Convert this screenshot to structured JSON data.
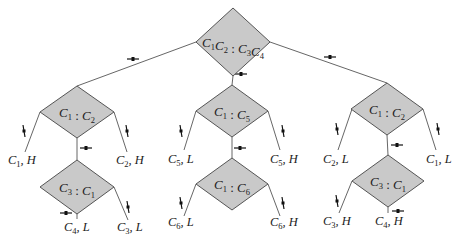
{
  "diagram": {
    "type": "decision-tree-comparison-weighing",
    "colors": {
      "node_fill": "#c9c9c9",
      "node_stroke": "#555555",
      "edge": "#555555",
      "background": "#ffffff"
    },
    "nodes": [
      {
        "id": "root",
        "parts": [
          [
            "C",
            "1"
          ],
          [
            "C",
            "2"
          ],
          [
            " : ",
            ""
          ],
          [
            "C",
            "3"
          ],
          [
            "C",
            "4"
          ]
        ],
        "text": "C1C2 : C3C4",
        "cx": 233,
        "cy": 42,
        "hw": 37,
        "hh": 34
      },
      {
        "id": "left",
        "parts": [
          [
            "C",
            "1"
          ],
          [
            " : ",
            ""
          ],
          [
            "C",
            "2"
          ]
        ],
        "text": "C1 : C2",
        "cx": 77,
        "cy": 112,
        "hw": 37,
        "hh": 26
      },
      {
        "id": "left-low",
        "parts": [
          [
            "C",
            "3"
          ],
          [
            " : ",
            ""
          ],
          [
            "C",
            "1"
          ]
        ],
        "text": "C3 : C1",
        "cx": 77,
        "cy": 187,
        "hw": 37,
        "hh": 27
      },
      {
        "id": "mid",
        "parts": [
          [
            "C",
            "1"
          ],
          [
            " : ",
            ""
          ],
          [
            "C",
            "5"
          ]
        ],
        "text": "C1 : C5",
        "cx": 232,
        "cy": 111,
        "hw": 36,
        "hh": 26
      },
      {
        "id": "mid-low",
        "parts": [
          [
            "C",
            "1"
          ],
          [
            " : ",
            ""
          ],
          [
            "C",
            "6"
          ]
        ],
        "text": "C1 : C6",
        "cx": 232,
        "cy": 184,
        "hw": 36,
        "hh": 26
      },
      {
        "id": "right",
        "parts": [
          [
            "C",
            "1"
          ],
          [
            " : ",
            ""
          ],
          [
            "C",
            "2"
          ]
        ],
        "text": "C1 : C2",
        "cx": 387,
        "cy": 109,
        "hw": 36,
        "hh": 26
      },
      {
        "id": "right-low",
        "parts": [
          [
            "C",
            "3"
          ],
          [
            " : ",
            ""
          ],
          [
            "C",
            "1"
          ]
        ],
        "text": "C3 : C1",
        "cx": 388,
        "cy": 181,
        "hw": 36,
        "hh": 26
      }
    ],
    "leaves": [
      {
        "text": "C1, H",
        "c": "C",
        "sub": "1",
        "rest": ", H",
        "x": 8,
        "y": 164
      },
      {
        "text": "C2, H",
        "c": "C",
        "sub": "2",
        "rest": ", H",
        "x": 116,
        "y": 164
      },
      {
        "text": "C4, L",
        "c": "C",
        "sub": "4",
        "rest": ", L",
        "x": 64,
        "y": 231
      },
      {
        "text": "C3, L",
        "c": "C",
        "sub": "3",
        "rest": ", L",
        "x": 117,
        "y": 231
      },
      {
        "text": "C5, L",
        "c": "C",
        "sub": "5",
        "rest": ", L",
        "x": 168,
        "y": 163
      },
      {
        "text": "C5, H",
        "c": "C",
        "sub": "5",
        "rest": ", H",
        "x": 270,
        "y": 163
      },
      {
        "text": "C6, L",
        "c": "C",
        "sub": "6",
        "rest": ", L",
        "x": 168,
        "y": 226
      },
      {
        "text": "C6, H",
        "c": "C",
        "sub": "6",
        "rest": ", H",
        "x": 270,
        "y": 226
      },
      {
        "text": "C2, L",
        "c": "C",
        "sub": "2",
        "rest": ", L",
        "x": 323,
        "y": 163
      },
      {
        "text": "C1, L",
        "c": "C",
        "sub": "1",
        "rest": ", L",
        "x": 426,
        "y": 163
      },
      {
        "text": "C3, H",
        "c": "C",
        "sub": "3",
        "rest": ", H",
        "x": 323,
        "y": 225
      },
      {
        "text": "C4, H",
        "c": "C",
        "sub": "4",
        "rest": ", H",
        "x": 375,
        "y": 225
      }
    ],
    "edges": [
      {
        "from": "root-left-corner",
        "points": [
          [
            196,
            42
          ],
          [
            77,
            86
          ]
        ],
        "marker": {
          "x": 133,
          "y": 59,
          "orient": "horizontal"
        }
      },
      {
        "from": "root-bottom",
        "points": [
          [
            233,
            76
          ],
          [
            232,
            85
          ]
        ],
        "marker": {
          "x": 241,
          "y": 74,
          "orient": "horizontal"
        }
      },
      {
        "from": "root-right-corner",
        "points": [
          [
            270,
            42
          ],
          [
            387,
            83
          ]
        ],
        "marker": {
          "x": 330,
          "y": 57,
          "orient": "horizontal"
        }
      },
      {
        "from": "left-to-C1H",
        "points": [
          [
            40,
            112
          ],
          [
            25,
            152
          ]
        ],
        "marker": {
          "x": 24,
          "y": 131,
          "orient": "vertical"
        }
      },
      {
        "from": "left-to-C2H",
        "points": [
          [
            114,
            112
          ],
          [
            127,
            152
          ]
        ],
        "marker": {
          "x": 127,
          "y": 131,
          "orient": "vertical"
        }
      },
      {
        "from": "left-to-leftlow",
        "points": [
          [
            77,
            138
          ],
          [
            77,
            160
          ]
        ],
        "marker": {
          "x": 86,
          "y": 148,
          "orient": "horizontal"
        }
      },
      {
        "from": "leftlow-to-C3L",
        "points": [
          [
            114,
            187
          ],
          [
            128,
            220
          ]
        ],
        "marker": {
          "x": 128,
          "y": 207,
          "orient": "vertical"
        }
      },
      {
        "from": "leftlow-to-C4L",
        "points": [
          [
            77,
            214
          ],
          [
            77,
            219
          ]
        ],
        "marker": {
          "x": 66,
          "y": 213,
          "orient": "horizontal"
        }
      },
      {
        "from": "mid-to-C5L",
        "points": [
          [
            196,
            111
          ],
          [
            184,
            150
          ]
        ],
        "marker": {
          "x": 181,
          "y": 131,
          "orient": "vertical"
        }
      },
      {
        "from": "mid-to-C5H",
        "points": [
          [
            268,
            111
          ],
          [
            280,
            150
          ]
        ],
        "marker": {
          "x": 283,
          "y": 131,
          "orient": "vertical"
        }
      },
      {
        "from": "mid-to-midlow",
        "points": [
          [
            232,
            137
          ],
          [
            232,
            158
          ]
        ],
        "marker": {
          "x": 240,
          "y": 148,
          "orient": "horizontal"
        }
      },
      {
        "from": "midlow-to-C6L",
        "points": [
          [
            196,
            184
          ],
          [
            184,
            216
          ]
        ],
        "marker": {
          "x": 181,
          "y": 203,
          "orient": "vertical"
        }
      },
      {
        "from": "midlow-to-C6H",
        "points": [
          [
            268,
            184
          ],
          [
            280,
            216
          ]
        ],
        "marker": {
          "x": 283,
          "y": 203,
          "orient": "vertical"
        }
      },
      {
        "from": "right-to-C2L",
        "points": [
          [
            352,
            109
          ],
          [
            338,
            150
          ]
        ],
        "marker": {
          "x": 337,
          "y": 129,
          "orient": "vertical"
        }
      },
      {
        "from": "right-to-C1L",
        "points": [
          [
            423,
            109
          ],
          [
            436,
            150
          ]
        ],
        "marker": {
          "x": 438,
          "y": 129,
          "orient": "vertical"
        }
      },
      {
        "from": "right-to-rightlow",
        "points": [
          [
            387,
            135
          ],
          [
            388,
            155
          ]
        ],
        "marker": {
          "x": 397,
          "y": 145,
          "orient": "horizontal"
        }
      },
      {
        "from": "rightlow-to-C3H",
        "points": [
          [
            352,
            181
          ],
          [
            339,
            213
          ]
        ],
        "marker": {
          "x": 337,
          "y": 201,
          "orient": "vertical"
        }
      },
      {
        "from": "rightlow-to-C4H",
        "points": [
          [
            388,
            207
          ],
          [
            388,
            213
          ]
        ],
        "marker": {
          "x": 398,
          "y": 211,
          "orient": "horizontal"
        }
      }
    ]
  }
}
